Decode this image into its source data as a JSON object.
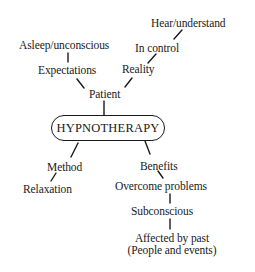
{
  "diagram": {
    "type": "mind-map",
    "central": "HYPNOTHERAPY",
    "nodes": {
      "hear_understand": "Hear/understand",
      "asleep_unconscious": "Asleep/unconscious",
      "in_control": "In control",
      "expectations": "Expectations",
      "reality": "Reality",
      "patient": "Patient",
      "method": "Method",
      "benefits": "Benefits",
      "relaxation": "Relaxation",
      "overcome_problems": "Overcome problems",
      "subconscious": "Subconscious",
      "affected_by_past": "Affected by past",
      "people_and_events": "(People and events)"
    },
    "edges": [
      [
        "Patient",
        "HYPNOTHERAPY"
      ],
      [
        "Expectations",
        "Patient"
      ],
      [
        "Reality",
        "Patient"
      ],
      [
        "Asleep/unconscious",
        "Expectations"
      ],
      [
        "In control",
        "Reality"
      ],
      [
        "Hear/understand",
        "In control"
      ],
      [
        "HYPNOTHERAPY",
        "Method"
      ],
      [
        "HYPNOTHERAPY",
        "Benefits"
      ],
      [
        "Method",
        "Relaxation"
      ],
      [
        "Benefits",
        "Overcome problems"
      ],
      [
        "Overcome problems",
        "Subconscious"
      ],
      [
        "Subconscious",
        "Affected by past (People and events)"
      ]
    ]
  }
}
